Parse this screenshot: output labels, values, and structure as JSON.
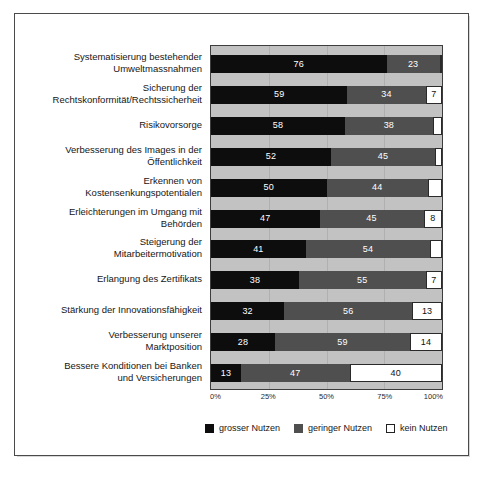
{
  "chart_data": {
    "type": "bar",
    "subtype": "stacked-horizontal-100",
    "title": "",
    "xlabel": "",
    "ylabel": "",
    "xlim": [
      0,
      100
    ],
    "xticks": [
      "0%",
      "25%",
      "50%",
      "75%",
      "100%"
    ],
    "xtick_values": [
      0,
      25,
      50,
      75,
      100
    ],
    "grid": true,
    "legend_position": "bottom-center",
    "categories": [
      "Systematisierung bestehender Umweltmassnahmen",
      "Sicherung der Rechtskonformität/Rechtssicherheit",
      "Risikovorsorge",
      "Verbesserung des Images in der Öffentlichkeit",
      "Erkennen von Kostensenkungspotentialen",
      "Erleichterungen im Umgang mit Behörden",
      "Steigerung der Mitarbeitermotivation",
      "Erlangung des Zertifikats",
      "Stärkung der Innovationsfähigkeit",
      "Verbesserung unserer Marktposition",
      "Bessere Konditionen bei Banken und Versicherungen"
    ],
    "category_lines": [
      [
        "Systematisierung bestehender",
        "Umweltmassnahmen"
      ],
      [
        "Sicherung der",
        "Rechtskonformität/Rechtssicherheit"
      ],
      [
        "Risikovorsorge"
      ],
      [
        "Verbesserung des Images in der",
        "Öffentlichkeit"
      ],
      [
        "Erkennen von",
        "Kostensenkungspotentialen"
      ],
      [
        "Erleichterungen im Umgang mit",
        "Behörden"
      ],
      [
        "Steigerung der",
        "Mitarbeitermotivation"
      ],
      [
        "Erlangung des Zertifikats"
      ],
      [
        "Stärkung der Innovationsfähigkeit"
      ],
      [
        "Verbesserung unserer",
        "Marktposition"
      ],
      [
        "Bessere Konditionen bei Banken",
        "und Versicherungen"
      ]
    ],
    "series": [
      {
        "name": "grosser Nutzen",
        "color": "#0d0d0d",
        "values": [
          76,
          59,
          58,
          52,
          50,
          47,
          41,
          38,
          32,
          28,
          13
        ]
      },
      {
        "name": "geringer Nutzen",
        "color": "#4f4f4f",
        "values": [
          23,
          34,
          38,
          45,
          44,
          45,
          54,
          55,
          56,
          59,
          47
        ]
      },
      {
        "name": "kein Nutzen",
        "color": "#ffffff",
        "values": [
          1,
          7,
          4,
          3,
          6,
          8,
          5,
          7,
          13,
          14,
          40
        ]
      }
    ],
    "value_labels": [
      {
        "big": "76",
        "small": "23",
        "none": ""
      },
      {
        "big": "59",
        "small": "34",
        "none": "7"
      },
      {
        "big": "58",
        "small": "38",
        "none": ""
      },
      {
        "big": "52",
        "small": "45",
        "none": ""
      },
      {
        "big": "50",
        "small": "44",
        "none": ""
      },
      {
        "big": "47",
        "small": "45",
        "none": "8"
      },
      {
        "big": "41",
        "small": "54",
        "none": ""
      },
      {
        "big": "38",
        "small": "55",
        "none": "7"
      },
      {
        "big": "32",
        "small": "56",
        "none": "13"
      },
      {
        "big": "28",
        "small": "59",
        "none": "14"
      },
      {
        "big": "13",
        "small": "47",
        "none": "40"
      }
    ]
  },
  "legend": {
    "items": [
      {
        "label": "grosser Nutzen",
        "swatch": "filled-black"
      },
      {
        "label": "geringer Nutzen",
        "swatch": "filled-gray"
      },
      {
        "label": "kein Nutzen",
        "swatch": "outline-white"
      }
    ]
  }
}
